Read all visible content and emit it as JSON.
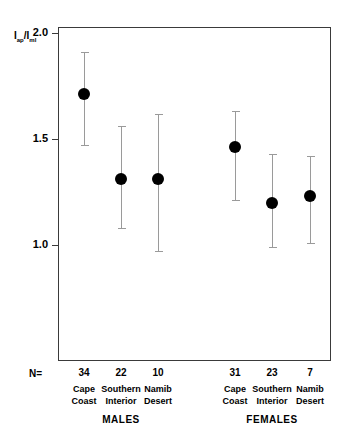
{
  "chart_data": {
    "type": "scatter",
    "title": "",
    "xlabel": "",
    "ylabel": "Iap/Iml",
    "ylabel_parts": {
      "num_main": "I",
      "num_sub": "ap",
      "slash": "/",
      "den_main": "I",
      "den_sub": "ml"
    },
    "ylim": [
      0.85,
      2.0
    ],
    "yticks": [
      2.0,
      1.5,
      1.0
    ],
    "ytick_labels": [
      "2.0",
      "1.5",
      "1.0"
    ],
    "grid": false,
    "legend": false,
    "error_type": "range",
    "n_label": "N=",
    "categories": [
      "Cape Coast",
      "Southern Interior",
      "Namib Desert",
      "Cape Coast",
      "Southern Interior",
      "Namib Desert"
    ],
    "groups": [
      {
        "label": "MALES",
        "categories": [
          "Cape Coast",
          "Southern Interior",
          "Namib Desert"
        ]
      },
      {
        "label": "FEMALES",
        "categories": [
          "Cape Coast",
          "Southern Interior",
          "Namib Desert"
        ]
      }
    ],
    "points": [
      {
        "group": "MALES",
        "name_line1": "Cape",
        "name_line2": "Coast",
        "n": "34",
        "value": 1.71,
        "low": 1.47,
        "high": 1.91
      },
      {
        "group": "MALES",
        "name_line1": "Southern",
        "name_line2": "Interior",
        "n": "22",
        "value": 1.31,
        "low": 1.08,
        "high": 1.56
      },
      {
        "group": "MALES",
        "name_line1": "Namib",
        "name_line2": "Desert",
        "n": "10",
        "value": 1.31,
        "low": 0.97,
        "high": 1.62
      },
      {
        "group": "FEMALES",
        "name_line1": "Cape",
        "name_line2": "Coast",
        "n": "31",
        "value": 1.46,
        "low": 1.21,
        "high": 1.63
      },
      {
        "group": "FEMALES",
        "name_line1": "Southern",
        "name_line2": "Interior",
        "n": "23",
        "value": 1.2,
        "low": 0.99,
        "high": 1.43
      },
      {
        "group": "FEMALES",
        "name_line1": "Namib",
        "name_line2": "Desert",
        "n": "7",
        "value": 1.23,
        "low": 1.01,
        "high": 1.42
      }
    ],
    "series": [
      {
        "name": "Iap/Iml mean",
        "values": [
          1.71,
          1.31,
          1.31,
          1.46,
          1.2,
          1.23
        ]
      },
      {
        "name": "lower bound",
        "values": [
          1.47,
          1.08,
          0.97,
          1.21,
          0.99,
          1.01
        ]
      },
      {
        "name": "upper bound",
        "values": [
          1.91,
          1.56,
          1.62,
          1.63,
          1.43,
          1.42
        ]
      }
    ],
    "sample_sizes": [
      "34",
      "22",
      "10",
      "31",
      "23",
      "7"
    ],
    "colors": {
      "marker": "#000000",
      "whisker": "#9a9a9a",
      "axis": "#3a3a3a",
      "background": "#ffffff"
    }
  }
}
